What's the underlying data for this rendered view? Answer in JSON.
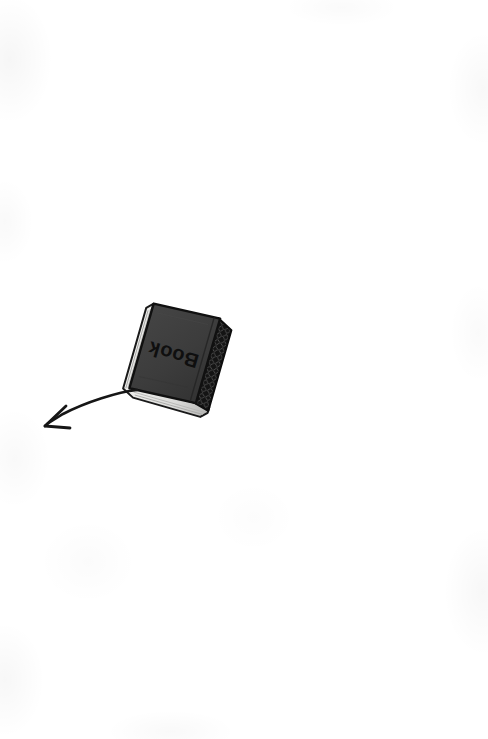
{
  "canvas": {
    "width": 488,
    "height": 739,
    "background_color": "#ffffff",
    "medium": "scanned drawing on white paper"
  },
  "objects": {
    "book": {
      "name": "Book",
      "cover_label": "Book",
      "label_orientation": "upside-down",
      "rotation_degrees": 196,
      "cover_color": "#3d3d3d",
      "cover_shadow_color": "#2b2b2b",
      "spine_color": "#141414",
      "spine_pattern": "diamond-stitch",
      "outline_color": "#111111",
      "pages_color": "#e8e8e6",
      "pages_edge_color": "#b9b9b7",
      "label_color": "#111111",
      "center_x": 180,
      "center_y": 357,
      "width": 84,
      "height": 96
    },
    "arrow": {
      "name": "pointer arrow",
      "direction": "down-left",
      "color": "#161616",
      "stroke_width": 2.6,
      "tail_x": 137,
      "tail_y": 390,
      "tip_x": 45,
      "tip_y": 426,
      "style": "hand-drawn curved"
    }
  }
}
